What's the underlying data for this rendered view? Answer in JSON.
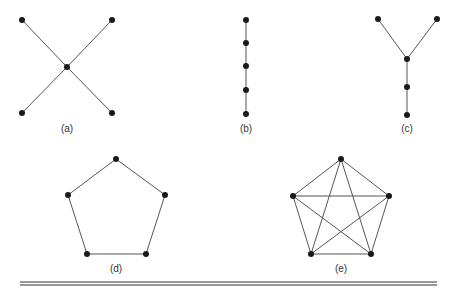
{
  "figure": {
    "graphs": [
      {
        "id": "a",
        "label": "(a)",
        "label_pos": [
          67,
          132
        ],
        "nodes": [
          [
            22,
            20
          ],
          [
            112,
            20
          ],
          [
            67,
            67
          ],
          [
            22,
            113
          ],
          [
            112,
            113
          ]
        ],
        "edges": [
          [
            0,
            2
          ],
          [
            1,
            2
          ],
          [
            2,
            3
          ],
          [
            2,
            4
          ]
        ]
      },
      {
        "id": "b",
        "label": "(b)",
        "label_pos": [
          246,
          132
        ],
        "nodes": [
          [
            246,
            20
          ],
          [
            246,
            43
          ],
          [
            246,
            66
          ],
          [
            246,
            90
          ],
          [
            246,
            114
          ]
        ],
        "edges": [
          [
            0,
            1
          ],
          [
            1,
            2
          ],
          [
            2,
            3
          ],
          [
            3,
            4
          ]
        ]
      },
      {
        "id": "c",
        "label": "(c)",
        "label_pos": [
          407,
          132
        ],
        "nodes": [
          [
            378,
            19
          ],
          [
            437,
            19
          ],
          [
            407,
            59
          ],
          [
            407,
            87
          ],
          [
            407,
            115
          ]
        ],
        "edges": [
          [
            0,
            2
          ],
          [
            1,
            2
          ],
          [
            2,
            3
          ],
          [
            3,
            4
          ]
        ]
      },
      {
        "id": "d",
        "label": "(d)",
        "label_pos": [
          116,
          272
        ],
        "nodes": [
          [
            116,
            159
          ],
          [
            165,
            195
          ],
          [
            146,
            254
          ],
          [
            87,
            254
          ],
          [
            68,
            195
          ]
        ],
        "edges": [
          [
            0,
            1
          ],
          [
            1,
            2
          ],
          [
            2,
            3
          ],
          [
            3,
            4
          ],
          [
            4,
            0
          ]
        ]
      },
      {
        "id": "e",
        "label": "(e)",
        "label_pos": [
          341,
          272
        ],
        "nodes": [
          [
            341,
            159
          ],
          [
            389,
            196
          ],
          [
            371,
            254
          ],
          [
            311,
            254
          ],
          [
            293,
            196
          ]
        ],
        "edges": [
          [
            0,
            1
          ],
          [
            0,
            2
          ],
          [
            0,
            3
          ],
          [
            0,
            4
          ],
          [
            1,
            2
          ],
          [
            1,
            3
          ],
          [
            1,
            4
          ],
          [
            2,
            3
          ],
          [
            2,
            4
          ],
          [
            3,
            4
          ]
        ]
      }
    ],
    "rule": {
      "x1": 20,
      "x2": 437,
      "y1": 282,
      "y2": 285
    },
    "colors": {
      "node": "#1a1a1a",
      "edge": "#555555",
      "label": "#333333"
    }
  }
}
